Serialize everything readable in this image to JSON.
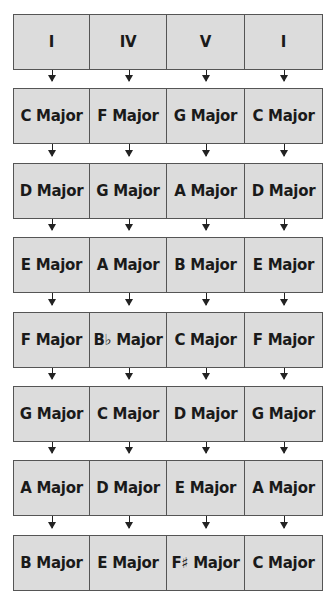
{
  "diagram": {
    "columns": 4,
    "rows": [
      [
        "I",
        "IV",
        "V",
        "I"
      ],
      [
        "C Major",
        "F Major",
        "G Major",
        "C Major"
      ],
      [
        "D Major",
        "G Major",
        "A Major",
        "D Major"
      ],
      [
        "E Major",
        "A Major",
        "B Major",
        "E Major"
      ],
      [
        "F Major",
        "B♭ Major",
        "C Major",
        "F Major"
      ],
      [
        "G Major",
        "C Major",
        "D Major",
        "G Major"
      ],
      [
        "A Major",
        "D Major",
        "E Major",
        "A Major"
      ],
      [
        "B Major",
        "E Major",
        "F♯ Major",
        "C Major"
      ]
    ],
    "colors": {
      "cell_fill": "#dcdcdc",
      "cell_border": "#555555",
      "arrow": "#222222"
    }
  }
}
